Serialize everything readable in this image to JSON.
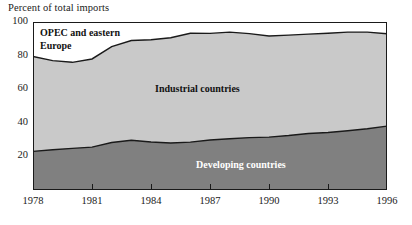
{
  "chart_data": {
    "type": "area",
    "title": "",
    "subtitle": "",
    "ylabel": "Percent of total imports",
    "xlabel": "",
    "ylim": [
      0,
      100
    ],
    "xlim": [
      1978,
      1996
    ],
    "grid": false,
    "legend_position": "inline-annotations",
    "stacked": true,
    "x": [
      1978,
      1979,
      1980,
      1981,
      1982,
      1983,
      1984,
      1985,
      1986,
      1987,
      1988,
      1989,
      1990,
      1991,
      1992,
      1993,
      1994,
      1995,
      1996
    ],
    "ytick_labels": [
      "20",
      "40",
      "60",
      "80",
      "100"
    ],
    "ytick_values": [
      20,
      40,
      60,
      80,
      100
    ],
    "xtick_labels": [
      "1978",
      "1981",
      "1984",
      "1987",
      "1990",
      "1993",
      "1996"
    ],
    "xtick_values": [
      1978,
      1981,
      1984,
      1987,
      1990,
      1993,
      1996
    ],
    "series": [
      {
        "name": "Developing countries",
        "color": "#808080",
        "values": [
          23.0,
          24.0,
          24.8,
          25.5,
          28.3,
          29.6,
          28.6,
          28.0,
          28.5,
          29.8,
          30.5,
          31.2,
          31.5,
          32.4,
          33.6,
          34.2,
          35.3,
          36.5,
          38.0
        ]
      },
      {
        "name": "Industrial countries",
        "color": "#c9c9c9",
        "values": [
          56.5,
          53.0,
          51.2,
          52.5,
          57.0,
          59.4,
          60.8,
          62.6,
          64.8,
          63.4,
          63.5,
          61.9,
          60.2,
          59.8,
          59.2,
          59.1,
          58.7,
          57.5,
          55.0
        ]
      },
      {
        "name": "OPEC and eastern Europe",
        "color": "#ffffff",
        "values": [
          20.5,
          23.0,
          24.0,
          22.0,
          14.7,
          11.0,
          10.6,
          9.4,
          6.7,
          6.8,
          6.0,
          6.9,
          8.3,
          7.8,
          7.2,
          6.7,
          6.0,
          6.0,
          7.0
        ]
      }
    ],
    "cumulative_upper_boundary": {
      "developing": [
        23.0,
        24.0,
        24.8,
        25.5,
        28.3,
        29.6,
        28.6,
        28.0,
        28.5,
        29.8,
        30.5,
        31.2,
        31.5,
        32.4,
        33.6,
        34.2,
        35.3,
        36.5,
        38.0
      ],
      "industrial": [
        79.5,
        77.0,
        76.0,
        78.0,
        85.3,
        89.0,
        89.4,
        90.6,
        93.3,
        93.2,
        94.0,
        93.1,
        91.7,
        92.2,
        92.8,
        93.3,
        94.0,
        94.0,
        93.0
      ]
    },
    "annotations": [
      {
        "text": "OPEC and eastern\nEurope",
        "name": "opec-eastern-europe-label"
      },
      {
        "text": "Industrial countries",
        "name": "industrial-countries-label"
      },
      {
        "text": "Developing countries",
        "name": "developing-countries-label"
      }
    ]
  },
  "labels": {
    "axis_title": "Percent of total imports",
    "opec": "OPEC and eastern\nEurope",
    "industrial": "Industrial countries",
    "developing": "Developing countries"
  },
  "colors": {
    "developing": "#808080",
    "industrial": "#c9c9c9",
    "opec": "#ffffff",
    "axis": "#1a1a1a",
    "line": "#1a1a1a",
    "background": "#ffffff"
  }
}
